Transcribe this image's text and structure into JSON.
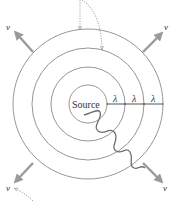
{
  "diagram": {
    "source_label": "Source",
    "wavelength_label": "λ",
    "velocity_label": "v",
    "center": {
      "x": 88,
      "y": 104
    },
    "wavefront_radii": [
      19,
      37,
      56,
      75
    ],
    "wavelength_markers": [
      {
        "label": "λ",
        "from_x": 107,
        "to_x": 125
      },
      {
        "label": "λ",
        "from_x": 125,
        "to_x": 144
      },
      {
        "label": "λ",
        "from_x": 144,
        "to_x": 163
      }
    ],
    "velocity_arrows": [
      {
        "position": "top-left",
        "label": "v"
      },
      {
        "position": "top-right",
        "label": "v"
      },
      {
        "position": "bottom-left",
        "label": "v"
      },
      {
        "position": "bottom-right",
        "label": "v"
      }
    ],
    "colors": {
      "wavefront": "#8a8a8a",
      "arrow": "#9a9a9a",
      "wave": "#6f6f6f",
      "dotted": "#888888",
      "text": "#333333"
    }
  }
}
